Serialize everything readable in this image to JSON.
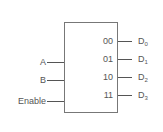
{
  "diagram": {
    "type": "decoder",
    "inputs": [
      {
        "label": "A"
      },
      {
        "label": "B"
      },
      {
        "label": "Enable"
      }
    ],
    "outputs": [
      {
        "code": "00",
        "label": "D",
        "sub": "0"
      },
      {
        "code": "01",
        "label": "D",
        "sub": "1"
      },
      {
        "code": "10",
        "label": "D",
        "sub": "2"
      },
      {
        "code": "11",
        "label": "D",
        "sub": "3"
      }
    ]
  }
}
